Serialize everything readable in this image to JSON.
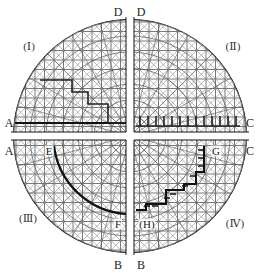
{
  "diagram": {
    "center": [
      130,
      136
    ],
    "radius": 117,
    "gap": {
      "vertical_x": [
        126,
        134
      ],
      "horizontal_y": [
        132,
        140
      ]
    },
    "colors": {
      "mesh": "#555555",
      "mesh_light": "#8a8a8a",
      "boundary": "#111111",
      "background": "#ffffff"
    },
    "section_labels": {
      "top_left": "D",
      "top_right": "D",
      "bottom_left": "B",
      "bottom_right": "B",
      "left_upper": "A",
      "left_lower": "A",
      "right_upper": "C",
      "right_lower": "C"
    },
    "quadrants": [
      {
        "id": "I",
        "label": "(Ⅰ)"
      },
      {
        "id": "II",
        "label": "(Ⅱ)"
      },
      {
        "id": "III",
        "label": "(Ⅲ)"
      },
      {
        "id": "IV",
        "label": "(Ⅳ)"
      }
    ],
    "points": {
      "E": "E",
      "F": "F",
      "G": "G",
      "H": "(H)"
    }
  }
}
